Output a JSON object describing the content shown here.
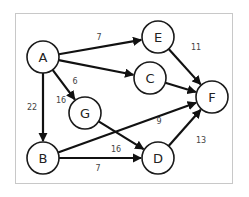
{
  "diagram": {
    "type": "directed-weighted-graph",
    "frame_color": "#c8c8c8",
    "node_stroke": "#1a1a1a",
    "edge_color": "#111111",
    "nodes": [
      {
        "id": "A",
        "label": "A",
        "x": 43,
        "y": 57
      },
      {
        "id": "E",
        "label": "E",
        "x": 158,
        "y": 37
      },
      {
        "id": "C",
        "label": "C",
        "x": 150,
        "y": 78
      },
      {
        "id": "G",
        "label": "G",
        "x": 85,
        "y": 113
      },
      {
        "id": "F",
        "label": "F",
        "x": 212,
        "y": 97
      },
      {
        "id": "B",
        "label": "B",
        "x": 43,
        "y": 158
      },
      {
        "id": "D",
        "label": "D",
        "x": 158,
        "y": 158
      }
    ],
    "edges": [
      {
        "from": "A",
        "to": "E",
        "weight": "7",
        "lx": 99,
        "ly": 37
      },
      {
        "from": "A",
        "to": "C",
        "weight": "6",
        "lx": 75,
        "ly": 81
      },
      {
        "from": "A",
        "to": "G",
        "weight": "16",
        "lx": 61,
        "ly": 100
      },
      {
        "from": "A",
        "to": "B",
        "weight": "22",
        "lx": 32,
        "ly": 107
      },
      {
        "from": "E",
        "to": "F",
        "weight": "11",
        "lx": 196,
        "ly": 47
      },
      {
        "from": "C",
        "to": "F",
        "weight": "6",
        "lx": 161,
        "ly": 76
      },
      {
        "from": "G",
        "to": "D",
        "weight": "16",
        "lx": 116,
        "ly": 149
      },
      {
        "from": "B",
        "to": "F",
        "weight": "9",
        "lx": 159,
        "ly": 121
      },
      {
        "from": "B",
        "to": "D",
        "weight": "7",
        "lx": 98,
        "ly": 168
      },
      {
        "from": "D",
        "to": "F",
        "weight": "13",
        "lx": 201,
        "ly": 140
      }
    ]
  }
}
